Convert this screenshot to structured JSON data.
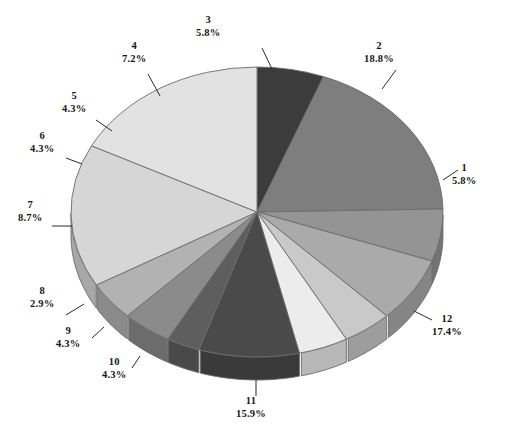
{
  "chart_data": {
    "type": "pie",
    "title": "",
    "subtitle": "",
    "xlabel": "",
    "ylabel": "",
    "grid": false,
    "legend_position": "none",
    "three_d": true,
    "label_format": "category on first line, percent on second line",
    "start_angle_deg": -90,
    "direction": "clockwise",
    "categories": [
      "1",
      "2",
      "3",
      "4",
      "5",
      "6",
      "7",
      "8",
      "9",
      "10",
      "11",
      "12"
    ],
    "values": [
      5.8,
      18.8,
      5.8,
      7.2,
      4.3,
      4.3,
      8.7,
      2.9,
      4.3,
      4.3,
      15.9,
      17.4
    ],
    "percent_labels": [
      "5.8%",
      "18.8%",
      "5.8%",
      "7.2%",
      "4.3%",
      "4.3%",
      "8.7%",
      "2.9%",
      "4.3%",
      "4.3%",
      "15.9%",
      "17.4%"
    ],
    "total_percent": 99.7,
    "slices": [
      {
        "name": "1",
        "percent": 5.8,
        "percent_label": "5.8%",
        "color": "#3c3c3c"
      },
      {
        "name": "2",
        "percent": 18.8,
        "percent_label": "18.8%",
        "color": "#7e7e7e"
      },
      {
        "name": "3",
        "percent": 5.8,
        "percent_label": "5.8%",
        "color": "#949494"
      },
      {
        "name": "4",
        "percent": 7.2,
        "percent_label": "7.2%",
        "color": "#aaaaaa"
      },
      {
        "name": "5",
        "percent": 4.3,
        "percent_label": "4.3%",
        "color": "#c9c9c9"
      },
      {
        "name": "6",
        "percent": 4.3,
        "percent_label": "4.3%",
        "color": "#ececec"
      },
      {
        "name": "7",
        "percent": 8.7,
        "percent_label": "8.7%",
        "color": "#4a4a4a"
      },
      {
        "name": "8",
        "percent": 2.9,
        "percent_label": "2.9%",
        "color": "#5e5e5e"
      },
      {
        "name": "9",
        "percent": 4.3,
        "percent_label": "4.3%",
        "color": "#8b8b8b"
      },
      {
        "name": "10",
        "percent": 4.3,
        "percent_label": "4.3%",
        "color": "#b2b2b2"
      },
      {
        "name": "11",
        "percent": 15.9,
        "percent_label": "15.9%",
        "color": "#d6d6d6"
      },
      {
        "name": "12",
        "percent": 17.4,
        "percent_label": "17.4%",
        "color": "#e2e2e2"
      }
    ],
    "colors": {
      "background": "#ffffff",
      "outline": "#6b6b6b",
      "label_text": "#161616",
      "leader_line": "#2b2b2b"
    }
  },
  "labels": {
    "s1": {
      "name": "1",
      "percent": "5.8%"
    },
    "s2": {
      "name": "2",
      "percent": "18.8%"
    },
    "s3": {
      "name": "3",
      "percent": "5.8%"
    },
    "s4": {
      "name": "4",
      "percent": "7.2%"
    },
    "s5": {
      "name": "5",
      "percent": "4.3%"
    },
    "s6": {
      "name": "6",
      "percent": "4.3%"
    },
    "s7": {
      "name": "7",
      "percent": "8.7%"
    },
    "s8": {
      "name": "8",
      "percent": "2.9%"
    },
    "s9": {
      "name": "9",
      "percent": "4.3%"
    },
    "s10": {
      "name": "10",
      "percent": "4.3%"
    },
    "s11": {
      "name": "11",
      "percent": "15.9%"
    },
    "s12": {
      "name": "12",
      "percent": "17.4%"
    }
  },
  "label_positions": {
    "s1": {
      "left": 452,
      "top": 162
    },
    "s2": {
      "left": 364,
      "top": 40
    },
    "s3": {
      "left": 196,
      "top": 14
    },
    "s4": {
      "left": 122,
      "top": 40
    },
    "s5": {
      "left": 62,
      "top": 90
    },
    "s6": {
      "left": 30,
      "top": 130
    },
    "s7": {
      "left": 18,
      "top": 199
    },
    "s8": {
      "left": 30,
      "top": 285
    },
    "s9": {
      "left": 56,
      "top": 325
    },
    "s10": {
      "left": 102,
      "top": 356
    },
    "s11": {
      "left": 236,
      "top": 395
    },
    "s12": {
      "left": 432,
      "top": 313
    }
  },
  "leader_lines": {
    "s1": {
      "x1": 443,
      "y1": 180,
      "x2": 458,
      "y2": 170
    },
    "s2": {
      "x1": 382,
      "y1": 89,
      "x2": 396,
      "y2": 70
    },
    "s3": {
      "x1": 272,
      "y1": 69,
      "x2": 262,
      "y2": 48
    },
    "s4": {
      "x1": 160,
      "y1": 96,
      "x2": 148,
      "y2": 74
    },
    "s5": {
      "x1": 112,
      "y1": 131,
      "x2": 96,
      "y2": 120
    },
    "s6": {
      "x1": 82,
      "y1": 164,
      "x2": 66,
      "y2": 158
    },
    "s7": {
      "x1": 72,
      "y1": 226,
      "x2": 52,
      "y2": 226
    },
    "s8": {
      "x1": 84,
      "y1": 304,
      "x2": 66,
      "y2": 315
    },
    "s9": {
      "x1": 104,
      "y1": 327,
      "x2": 92,
      "y2": 338
    },
    "s10": {
      "x1": 140,
      "y1": 356,
      "x2": 132,
      "y2": 368
    },
    "s11": {
      "x1": 256,
      "y1": 380,
      "x2": 256,
      "y2": 396
    },
    "s12": {
      "x1": 414,
      "y1": 311,
      "x2": 432,
      "y2": 320
    }
  },
  "geometry": {
    "cx": 257,
    "cy": 212,
    "rx": 186,
    "ry": 145,
    "depth": 23
  }
}
